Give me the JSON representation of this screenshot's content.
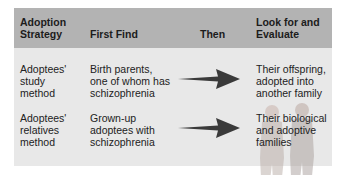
{
  "table": {
    "headers": [
      {
        "line1": "Adoption",
        "line2": "Strategy"
      },
      {
        "line1": "First Find"
      },
      {
        "line1": "Then"
      },
      {
        "line1": "Look for and",
        "line2": "Evaluate"
      }
    ],
    "rows": [
      {
        "strategy": [
          "Adoptees'",
          "study",
          "method"
        ],
        "first_find": [
          "Birth parents,",
          "one of whom has",
          "schizophrenia"
        ],
        "then": "arrow-right-icon",
        "evaluate": [
          "Their offspring,",
          "adopted into",
          "another family"
        ]
      },
      {
        "strategy": [
          "Adoptees'",
          "relatives",
          "method"
        ],
        "first_find": [
          "Grown-up",
          "adoptees with",
          "schizophrenia"
        ],
        "then": "arrow-right-icon",
        "evaluate": [
          "Their biological",
          "and adoptive",
          "families"
        ]
      }
    ]
  },
  "colors": {
    "header_bg": "#b3b3b3",
    "body_bg": "#e8e8e8",
    "arrow": "#3a3a3a"
  }
}
